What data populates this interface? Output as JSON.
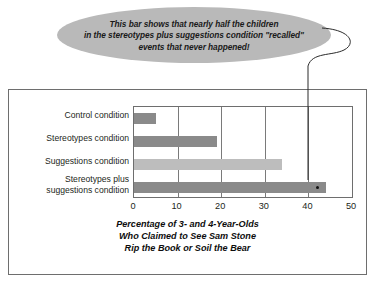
{
  "callout": {
    "lines": [
      "This bar shows that nearly half the children",
      "in the stereotypes plus suggestions condition \"recalled\"",
      "events that never happened!"
    ],
    "fill_color": "#b9b9b9",
    "pointer_target_value": 42
  },
  "chart_data": {
    "type": "bar",
    "orientation": "horizontal",
    "title": "",
    "categories": [
      "Control condition",
      "Stereotypes condition",
      "Suggestions condition",
      "Stereotypes plus suggestions condition"
    ],
    "category_lines": [
      [
        "Control condition"
      ],
      [
        "Stereotypes condition"
      ],
      [
        "Suggestions condition"
      ],
      [
        "Stereotypes plus",
        "suggestions condition"
      ]
    ],
    "values": [
      5,
      19,
      34,
      44
    ],
    "bar_colors": [
      "#8a8a8a",
      "#8a8a8a",
      "#bdbdbd",
      "#8a8a8a"
    ],
    "xlabel": "Percentage of 3- and 4-Year-Olds Who Claimed to See Sam Stone Rip the Book or Soil the Bear",
    "ylabel": "",
    "xlim": [
      0,
      50
    ],
    "xticks": [
      0,
      10,
      20,
      30,
      40,
      50
    ],
    "xtick_labels": [
      "0",
      "10",
      "20",
      "30",
      "40",
      "50"
    ],
    "grid": true,
    "legend": false
  },
  "caption": {
    "lines": [
      "Percentage of 3- and 4-Year-Olds",
      "Who Claimed to See Sam Stone",
      "Rip the Book or Soil the Bear"
    ]
  }
}
